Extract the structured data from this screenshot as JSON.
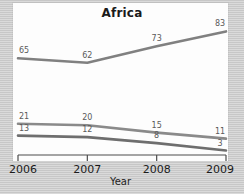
{
  "chart_data": {
    "type": "line",
    "title": "Africa",
    "xlabel": "Year",
    "ylabel": "",
    "categories": [
      "2006",
      "2007",
      "2008",
      "2009"
    ],
    "x": [
      2006,
      2007,
      2008,
      2009
    ],
    "xlim": [
      2006,
      2009
    ],
    "ylim": [
      0,
      90
    ],
    "grid": false,
    "legend": "none",
    "series": [
      {
        "name": "series-1",
        "color": "#808080",
        "values": [
          65,
          62,
          73,
          83
        ],
        "labels": [
          "65",
          "62",
          "73",
          "83"
        ]
      },
      {
        "name": "series-2",
        "color": "#8a8a8a",
        "values": [
          21,
          20,
          15,
          11
        ],
        "labels": [
          "21",
          "20",
          "15",
          "11"
        ]
      },
      {
        "name": "series-3",
        "color": "#6e6e6e",
        "values": [
          13,
          12,
          8,
          3
        ],
        "labels": [
          "13",
          "12",
          "8",
          "3"
        ]
      }
    ]
  },
  "axis": {
    "x_tick_labels": [
      "2006",
      "2007",
      "2008",
      "2009"
    ],
    "x_axis_title": "Year"
  },
  "colors": {
    "page_background": "#cacaca",
    "panel_background": "#fdfdfd",
    "axis": "#4d4d4d",
    "title_text": "#1a1a1a",
    "label_text": "#5a5a5a"
  }
}
